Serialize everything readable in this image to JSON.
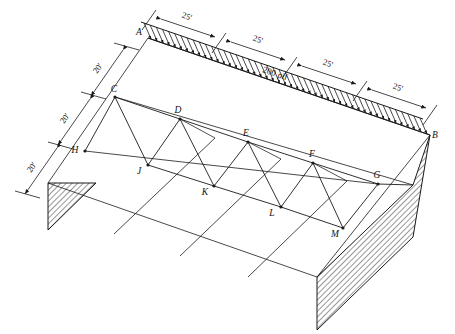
{
  "diagram": {
    "line_color": "#1a1a1a",
    "hatch_color": "#1a1a1a",
    "background": "#ffffff",
    "load": {
      "magnitude_label": "200 plf",
      "direction": "downward",
      "arrow_count": 46
    },
    "top_dimensions": [
      {
        "label": "25'"
      },
      {
        "label": "25'"
      },
      {
        "label": "25'"
      },
      {
        "label": "25'"
      }
    ],
    "left_dimensions": [
      {
        "label": "20'"
      },
      {
        "label": "20'"
      },
      {
        "label": "20'"
      }
    ],
    "nodes": [
      {
        "id": "A",
        "label": "A",
        "x": 148,
        "y": 38,
        "lx": -9,
        "ly": -3
      },
      {
        "id": "B",
        "label": "B",
        "x": 430,
        "y": 135,
        "lx": 5,
        "ly": 3
      },
      {
        "id": "C",
        "label": "C",
        "x": 115,
        "y": 97,
        "lx": -1,
        "ly": -5
      },
      {
        "id": "D",
        "label": "D",
        "x": 180,
        "y": 119,
        "lx": -2,
        "ly": -6
      },
      {
        "id": "E",
        "label": "E",
        "x": 248,
        "y": 142,
        "lx": -2,
        "ly": -6
      },
      {
        "id": "F",
        "label": "F",
        "x": 313,
        "y": 163,
        "lx": -1,
        "ly": -6
      },
      {
        "id": "G",
        "label": "G",
        "x": 378,
        "y": 184,
        "lx": -1,
        "ly": -6
      },
      {
        "id": "H",
        "label": "H",
        "x": 85,
        "y": 151,
        "lx": -10,
        "ly": 2
      },
      {
        "id": "J",
        "label": "J",
        "x": 148,
        "y": 165,
        "lx": -9,
        "ly": 9
      },
      {
        "id": "K",
        "label": "K",
        "x": 214,
        "y": 186,
        "lx": -9,
        "ly": 9
      },
      {
        "id": "L",
        "label": "L",
        "x": 281,
        "y": 207,
        "lx": -9,
        "ly": 9
      },
      {
        "id": "M",
        "label": "M",
        "x": 343,
        "y": 228,
        "lx": -8,
        "ly": 9
      }
    ]
  }
}
